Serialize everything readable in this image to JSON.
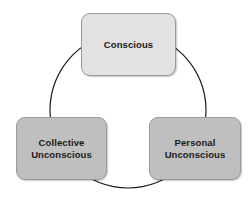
{
  "diagram": {
    "type": "cycle-diagram",
    "background_color": "#ffffff",
    "connector": {
      "shape": "circle",
      "color": "#1a1a1a",
      "stroke_width": 1.2,
      "center_x": 128,
      "center_y": 110,
      "radius": 78
    },
    "nodes": [
      {
        "id": "conscious",
        "label": "Conscious",
        "position": "top",
        "fill_color": "#e2e2e2",
        "border_color": "#9a9a9a",
        "text_color": "#1a1a1a"
      },
      {
        "id": "collective-unconscious",
        "label": "Collective\nUnconscious",
        "position": "bottom-left",
        "fill_color": "#bfbfbf",
        "border_color": "#9a9a9a",
        "text_color": "#1a1a1a"
      },
      {
        "id": "personal-unconscious",
        "label": "Personal\nUnconscious",
        "position": "bottom-right",
        "fill_color": "#bfbfbf",
        "border_color": "#9a9a9a",
        "text_color": "#1a1a1a"
      }
    ]
  }
}
